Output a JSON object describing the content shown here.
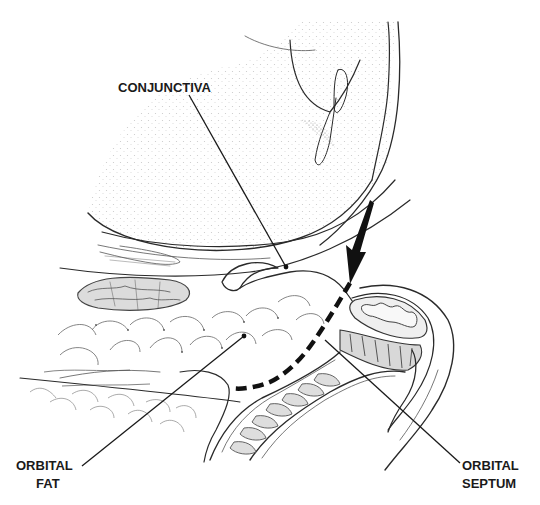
{
  "figure": {
    "colors": {
      "ink": "#2a2a2a",
      "stipple": "#9a9a9a",
      "muscle_fill": "#d6d6d6",
      "septum_dash": "#111111",
      "background": "#ffffff"
    },
    "labels": [
      {
        "id": "conjunctiva",
        "lines": [
          "CONJUNCTIVA"
        ]
      },
      {
        "id": "orbital-fat",
        "lines": [
          "ORBITAL",
          "FAT"
        ]
      },
      {
        "id": "orbital-septum",
        "lines": [
          "ORBITAL",
          "SEPTUM"
        ]
      }
    ],
    "annotations": {
      "arrow": "arrow pointing at orbital septum insertion near eyelid margin",
      "dashed_line": "orbital septum path (dashed)"
    }
  }
}
